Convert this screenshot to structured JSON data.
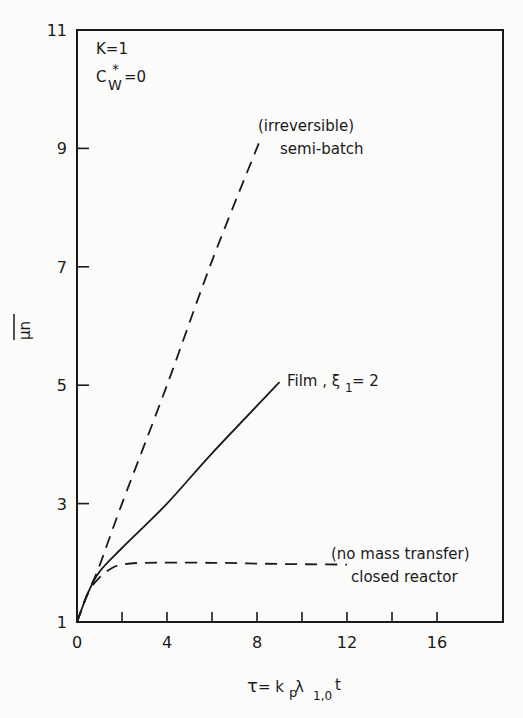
{
  "chart_data": {
    "type": "line",
    "title": "",
    "xlabel": "τ = kp λ1,0 t",
    "ylabel": "μ̄n",
    "xlim": [
      0,
      18.5
    ],
    "ylim": [
      1,
      11
    ],
    "x_ticks": [
      0,
      4,
      8,
      12,
      16
    ],
    "x_minor_ticks": [
      2,
      6,
      10,
      14
    ],
    "y_ticks": [
      1,
      3,
      5,
      7,
      9,
      11
    ],
    "grid": false,
    "annotations": {
      "params_line1": "K=1",
      "params_line2_base": "C",
      "params_line2_sup": "*",
      "params_line2_sub": "W",
      "params_line2_rest": "=0"
    },
    "series": [
      {
        "name": "(irreversible) semi-batch",
        "label_line1": "(irreversible)",
        "label_line2": "semi-batch",
        "style": "dashed",
        "x": [
          0,
          0.5,
          1,
          2,
          4,
          6,
          8.2
        ],
        "y": [
          1,
          1.5,
          1.95,
          3.0,
          5.0,
          7.1,
          9.2
        ]
      },
      {
        "name": "Film, ξ1 = 2",
        "label": "Film , ξ1 = 2",
        "label_base": "Film , ξ",
        "label_sub": "1",
        "label_rest": " = 2",
        "style": "solid",
        "x": [
          0,
          0.5,
          1,
          2,
          4,
          6,
          9
        ],
        "y": [
          1,
          1.5,
          1.85,
          2.25,
          3.0,
          3.85,
          5.05
        ]
      },
      {
        "name": "(no mass transfer) closed reactor",
        "label_line1": "(no mass transfer)",
        "label_line2": "closed reactor",
        "style": "dashed",
        "x": [
          0,
          0.5,
          1,
          1.5,
          2,
          3,
          6,
          9,
          12
        ],
        "y": [
          1,
          1.5,
          1.75,
          1.9,
          1.97,
          2.0,
          2.0,
          1.98,
          1.97
        ]
      }
    ]
  },
  "axis": {
    "x_tick_labels": [
      "0",
      "4",
      "8",
      "12",
      "16"
    ],
    "y_tick_labels": [
      "1",
      "3",
      "5",
      "7",
      "9",
      "11"
    ],
    "xlabel_tau": "τ",
    "xlabel_eq": " = k",
    "xlabel_p": "p",
    "xlabel_lambda": " λ",
    "xlabel_sub": "1,0",
    "xlabel_t": " t",
    "ylabel_text": "μn"
  }
}
